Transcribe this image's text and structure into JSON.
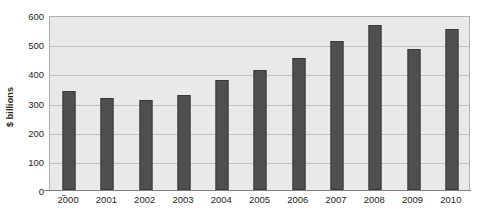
{
  "chart_data": {
    "type": "bar",
    "title": "",
    "xlabel": "",
    "ylabel": "$ billions",
    "categories": [
      "2000",
      "2001",
      "2002",
      "2003",
      "2004",
      "2005",
      "2006",
      "2007",
      "2008",
      "2009",
      "2010"
    ],
    "values": [
      338,
      315,
      308,
      325,
      378,
      413,
      452,
      510,
      565,
      484,
      551
    ],
    "ylim": [
      0,
      600
    ],
    "ytick_labels": [
      "0",
      "100",
      "200",
      "300",
      "400",
      "500",
      "600"
    ],
    "ytick_values": [
      0,
      100,
      200,
      300,
      400,
      500,
      600
    ],
    "grid": true,
    "legend": "none",
    "series_name": "",
    "colors": {
      "bar": "#4f4f4f",
      "bar_border": "#3a3a3a",
      "plot_background": "#e9e9e9",
      "gridline": "#bfbfbf",
      "plot_border": "#b0b0b0",
      "axis": "#808080",
      "text": "#231f20",
      "page_background": "#ffffff"
    }
  }
}
